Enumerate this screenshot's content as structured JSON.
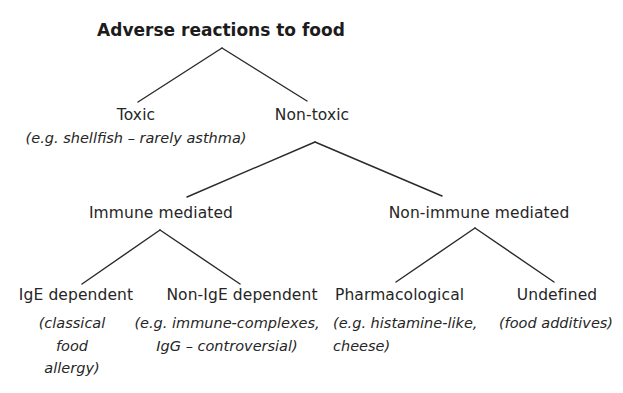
{
  "diagram": {
    "title": "Adverse reactions to food",
    "nodes": {
      "toxic": {
        "label": "Toxic",
        "note": [
          "(e.g. shellfish – rarely asthma)"
        ]
      },
      "non_toxic": {
        "label": "Non-toxic"
      },
      "immune_mediated": {
        "label": "Immune mediated"
      },
      "non_immune_mediated": {
        "label": "Non-immune mediated"
      },
      "ige_dependent": {
        "label": "IgE dependent",
        "note": [
          "(classical",
          "food",
          "allergy)"
        ]
      },
      "non_ige_dependent": {
        "label": "Non-IgE dependent",
        "note": [
          "(e.g. immune-complexes,",
          "IgG – controversial)"
        ]
      },
      "pharmacological": {
        "label": "Pharmacological",
        "note": [
          "(e.g. histamine-like,",
          "cheese)"
        ]
      },
      "undefined": {
        "label": "Undefined",
        "note": [
          "(food additives)"
        ]
      }
    },
    "edges": [
      {
        "from": "Adverse reactions to food",
        "to": "Toxic"
      },
      {
        "from": "Adverse reactions to food",
        "to": "Non-toxic"
      },
      {
        "from": "Non-toxic",
        "to": "Immune mediated"
      },
      {
        "from": "Non-toxic",
        "to": "Non-immune mediated"
      },
      {
        "from": "Immune mediated",
        "to": "IgE dependent"
      },
      {
        "from": "Immune mediated",
        "to": "Non-IgE dependent"
      },
      {
        "from": "Non-immune mediated",
        "to": "Pharmacological"
      },
      {
        "from": "Non-immune mediated",
        "to": "Undefined"
      }
    ],
    "colors": {
      "text": "#262626",
      "lines": "#2a2a2a",
      "background": "#ffffff"
    }
  }
}
